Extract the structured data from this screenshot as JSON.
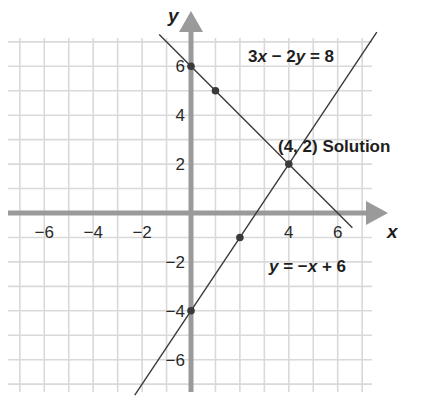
{
  "chart_data": {
    "type": "line",
    "title": "",
    "xlabel": "x",
    "ylabel": "y",
    "xlim": [
      -7,
      7
    ],
    "ylim": [
      -7,
      7
    ],
    "grid": true,
    "x_ticks": [
      -6,
      -4,
      -2,
      4,
      6
    ],
    "y_ticks": [
      6,
      4,
      2,
      -2,
      -4,
      -6
    ],
    "x_tick_labels": [
      "−6",
      "−4",
      "−2",
      "4",
      "6"
    ],
    "y_tick_labels": [
      "6",
      "4",
      "2",
      "−2",
      "−4",
      "−6"
    ],
    "series": [
      {
        "name": "3x − 2y = 8",
        "equation": "y = 1.5x - 4",
        "slope": 1.5,
        "intercept": -4,
        "x_range": [
          -2.3,
          7.6
        ],
        "points": [
          [
            0,
            -4
          ],
          [
            2,
            -1
          ]
        ]
      },
      {
        "name": "y = −x + 6",
        "equation": "y = -x + 6",
        "slope": -1,
        "intercept": 6,
        "x_range": [
          -1.3,
          6.6
        ],
        "points": [
          [
            0,
            6
          ],
          [
            1,
            5
          ]
        ]
      }
    ],
    "annotations": [
      {
        "text": "(4, 2) Solution",
        "x": 4,
        "y": 2,
        "type": "intersection"
      },
      {
        "text": "3x − 2y = 8",
        "label_for": "series-0"
      },
      {
        "text": "y = −x + 6",
        "label_for": "series-1"
      }
    ],
    "solution": {
      "x": 4,
      "y": 2,
      "label": "(4, 2) Solution"
    }
  },
  "labels": {
    "x_axis": "x",
    "y_axis": "y",
    "eq1_parts": [
      "3",
      "x",
      " − 2",
      "y",
      " = 8"
    ],
    "eq2_parts": [
      "y",
      " = −",
      "x",
      " + 6"
    ],
    "solution": "(4, 2) Solution"
  },
  "colors": {
    "grid": "#d9d9d9",
    "axis": "#9a9a9a",
    "line": "#3a3a3a",
    "point": "#3a3a3a",
    "text": "#1e1e1e"
  }
}
